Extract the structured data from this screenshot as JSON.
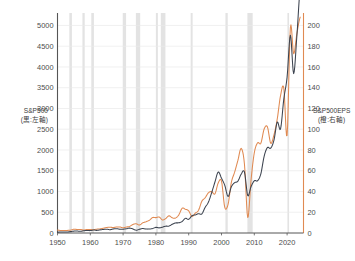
{
  "chart_data": {
    "type": "line",
    "title": "",
    "xlabel": "",
    "grid": true,
    "legend_position": "axis-labels",
    "colors": {
      "sp500_line": "#3d4450",
      "eps_line": "#e08a52",
      "right_axis": "#e08a52",
      "left_axis": "#555555",
      "grid": "#e9e9e9",
      "recession_band": "#d8d8d8",
      "background": "#ffffff",
      "text": "#4d4d4d"
    },
    "axes": {
      "x": {
        "label": "",
        "min": 1950,
        "max": 2025,
        "ticks": [
          1950,
          1960,
          1970,
          1980,
          1990,
          2000,
          2010,
          2020
        ],
        "tick_labels": [
          "1950",
          "1960",
          "1970",
          "1980",
          "1990",
          "2000",
          "2010",
          "2020"
        ]
      },
      "y_left": {
        "label": "S&P500",
        "label_line2": "(黒:左軸)",
        "series_color_note": "black",
        "min": 0,
        "max": 5300,
        "ticks": [
          0,
          500,
          1000,
          1500,
          2000,
          2500,
          3000,
          3500,
          4000,
          4500,
          5000
        ],
        "tick_labels": [
          "0",
          "500",
          "1000",
          "1500",
          "2000",
          "2500",
          "3000",
          "3500",
          "4000",
          "4500",
          "5000"
        ]
      },
      "y_right": {
        "label": "S&P500EPS",
        "label_line2": "(橙:右軸)",
        "series_color_note": "orange",
        "min": 0,
        "max": 212,
        "ticks": [
          0,
          20,
          40,
          60,
          80,
          100,
          120,
          140,
          160,
          180,
          200
        ],
        "tick_labels": [
          "0",
          "20",
          "40",
          "60",
          "80",
          "100",
          "120",
          "140",
          "160",
          "180",
          "200"
        ]
      }
    },
    "series": [
      {
        "name": "S&P500",
        "axis": "left",
        "color": "#3d4450",
        "x": [
          1950,
          1951,
          1952,
          1953,
          1954,
          1955,
          1956,
          1957,
          1958,
          1959,
          1960,
          1961,
          1962,
          1963,
          1964,
          1965,
          1966,
          1967,
          1968,
          1969,
          1970,
          1971,
          1972,
          1973,
          1974,
          1975,
          1976,
          1977,
          1978,
          1979,
          1980,
          1981,
          1982,
          1983,
          1984,
          1985,
          1986,
          1987,
          1988,
          1989,
          1990,
          1991,
          1992,
          1993,
          1994,
          1995,
          1996,
          1997,
          1998,
          1999,
          2000,
          2001,
          2002,
          2003,
          2004,
          2005,
          2006,
          2007,
          2008,
          2009,
          2010,
          2011,
          2012,
          2013,
          2014,
          2015,
          2016,
          2017,
          2018,
          2019,
          2020,
          2021,
          2022,
          2023,
          2024
        ],
        "values": [
          20,
          23,
          26,
          25,
          35,
          45,
          47,
          40,
          55,
          60,
          58,
          72,
          63,
          75,
          85,
          92,
          80,
          97,
          104,
          92,
          92,
          102,
          118,
          97,
          68,
          90,
          107,
          95,
          96,
          108,
          136,
          123,
          141,
          165,
          167,
          211,
          242,
          247,
          278,
          353,
          330,
          417,
          436,
          466,
          459,
          616,
          741,
          970,
          1229,
          1469,
          1320,
          1148,
          880,
          1112,
          1212,
          1248,
          1418,
          1468,
          903,
          1115,
          1258,
          1258,
          1426,
          1848,
          2059,
          2044,
          2239,
          2674,
          2507,
          3231,
          3756,
          4766,
          3840,
          4770,
          5900
        ],
        "note": "Year-end S&P 500 index level"
      },
      {
        "name": "S&P500EPS",
        "axis": "right",
        "color": "#e08a52",
        "x": [
          1950,
          1951,
          1952,
          1953,
          1954,
          1955,
          1956,
          1957,
          1958,
          1959,
          1960,
          1961,
          1962,
          1963,
          1964,
          1965,
          1966,
          1967,
          1968,
          1969,
          1970,
          1971,
          1972,
          1973,
          1974,
          1975,
          1976,
          1977,
          1978,
          1979,
          1980,
          1981,
          1982,
          1983,
          1984,
          1985,
          1986,
          1987,
          1988,
          1989,
          1990,
          1991,
          1992,
          1993,
          1994,
          1995,
          1996,
          1997,
          1998,
          1999,
          2000,
          2001,
          2002,
          2003,
          2004,
          2005,
          2006,
          2007,
          2008,
          2009,
          2010,
          2011,
          2012,
          2013,
          2014,
          2015,
          2016,
          2017,
          2018,
          2019,
          2020,
          2021,
          2022,
          2023,
          2024
        ],
        "values": [
          2.8,
          2.4,
          2.4,
          2.5,
          2.8,
          3.6,
          3.4,
          3.4,
          2.9,
          3.4,
          3.3,
          3.2,
          3.7,
          4.0,
          4.6,
          5.3,
          5.6,
          5.3,
          5.8,
          5.8,
          5.1,
          5.7,
          6.4,
          8.2,
          8.9,
          7.7,
          9.8,
          10.9,
          12.3,
          14.9,
          14.8,
          15.4,
          12.6,
          14.0,
          16.6,
          14.6,
          14.5,
          17.5,
          23.8,
          22.9,
          21.3,
          15.9,
          19.1,
          21.9,
          30.6,
          33.9,
          38.7,
          39.9,
          37.7,
          48.2,
          50.0,
          24.7,
          27.6,
          48.7,
          58.6,
          69.9,
          81.5,
          66.2,
          14.9,
          50.9,
          77.3,
          86.9,
          86.5,
          100.2,
          102.3,
          86.5,
          94.6,
          109.9,
          132.4,
          139.5,
          94.1,
          197.9,
          172.7,
          192.5,
          208.0
        ],
        "note": "Trailing 12-month operating earnings per share"
      }
    ],
    "recession_bands": [
      {
        "start": 1953.6,
        "end": 1954.4
      },
      {
        "start": 1957.6,
        "end": 1958.3
      },
      {
        "start": 1960.3,
        "end": 1961.1
      },
      {
        "start": 1969.9,
        "end": 1970.9
      },
      {
        "start": 1973.9,
        "end": 1975.2
      },
      {
        "start": 1980.0,
        "end": 1980.6
      },
      {
        "start": 1981.5,
        "end": 1982.9
      },
      {
        "start": 1990.6,
        "end": 1991.2
      },
      {
        "start": 2001.2,
        "end": 2001.9
      },
      {
        "start": 2007.9,
        "end": 2009.5
      },
      {
        "start": 2020.1,
        "end": 2020.5
      }
    ]
  }
}
